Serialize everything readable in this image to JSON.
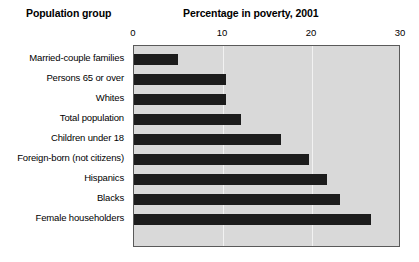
{
  "headers": {
    "left": "Population group",
    "right": "Percentage in poverty, 2001"
  },
  "chart_data": {
    "type": "bar",
    "orientation": "horizontal",
    "title": "Percentage in poverty, 2001",
    "xlabel": "Percentage in poverty, 2001",
    "ylabel": "Population group",
    "xlim": [
      0,
      30
    ],
    "ticks": [
      "0",
      "10",
      "20",
      "30"
    ],
    "tick_values": [
      0,
      10,
      20,
      30
    ],
    "grid": true,
    "gridlines_at": [
      10,
      20
    ],
    "legend": "none",
    "bar_color": "#1c1c1c",
    "plot_background": "#d9d9d9",
    "categories": [
      "Married-couple families",
      "Persons 65 or over",
      "Whites",
      "Total population",
      "Children under 18",
      "Foreign-born (not citizens)",
      "Hispanics",
      "Blacks",
      "Female householders"
    ],
    "values": [
      4.9,
      10.3,
      10.3,
      12.0,
      16.5,
      19.7,
      21.7,
      23.1,
      26.6
    ]
  }
}
